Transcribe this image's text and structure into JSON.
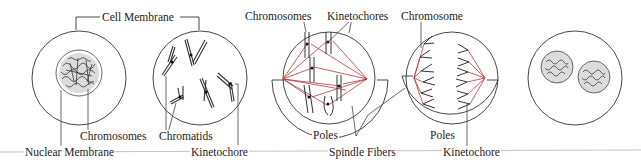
{
  "colors": {
    "line": "#333333",
    "spindle": "#b03a3a",
    "baseline": "#bbbbbb",
    "background": "#ffffff"
  },
  "stages": [
    {
      "id": "interphase",
      "cx": 79,
      "cy": 78,
      "r": 47
    },
    {
      "id": "prophase",
      "cx": 200,
      "cy": 78,
      "r": 47
    },
    {
      "id": "metaphase",
      "cx": 329,
      "cy": 78,
      "r": 46
    },
    {
      "id": "anaphase",
      "cx": 452,
      "cy": 78,
      "r": 46
    },
    {
      "id": "telophase",
      "cx": 575,
      "cy": 78,
      "r": 47
    }
  ],
  "labels": {
    "cell_membrane": "Cell Membrane",
    "chromosomes_1": "Chromosomes",
    "nuclear_membrane": "Nuclear Membrane",
    "chromatids": "Chromatids",
    "kinetochore_1": "Kinetochore",
    "chromosomes_2": "Chromosomes",
    "kinetochores": "Kinetochores",
    "poles_1": "Poles",
    "spindle_fibers": "Spindle Fibers",
    "chromosome": "Chromosome",
    "poles_2": "Poles",
    "kinetochore_2": "Kinetochore"
  }
}
